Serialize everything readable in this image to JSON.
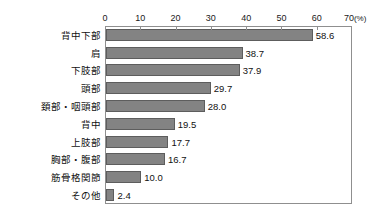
{
  "clipped_header": {
    "left_fragment": "",
    "right_fragment": ""
  },
  "chart_data": {
    "type": "bar",
    "orientation": "horizontal",
    "title": "",
    "xlabel": "(%)",
    "ylabel": "",
    "xlim": [
      0,
      70
    ],
    "xticks": [
      0,
      10,
      20,
      30,
      40,
      50,
      60,
      70
    ],
    "xtick_labels": [
      "0",
      "10",
      "20",
      "30",
      "40",
      "50",
      "60",
      "70"
    ],
    "unit_label": "(%)",
    "grid": false,
    "legend": false,
    "bar_color": "#838383",
    "bar_edge_color": "#5d5d5d",
    "frame_color": "#8f8f8f",
    "categories": [
      "背中下部",
      "肩",
      "下肢部",
      "頭部",
      "頚部・咽頭部",
      "背中",
      "上肢部",
      "胸部・腹部",
      "筋骨格関節",
      "その他"
    ],
    "values": [
      58.6,
      38.7,
      37.9,
      29.7,
      28.0,
      19.5,
      17.7,
      16.7,
      10.0,
      2.4
    ],
    "value_labels": [
      "58.6",
      "38.7",
      "37.9",
      "29.7",
      "28.0",
      "19.5",
      "17.7",
      "16.7",
      "10.0",
      "2.4"
    ]
  }
}
